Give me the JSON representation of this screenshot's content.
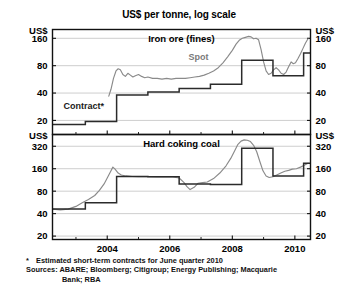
{
  "chart_data": {
    "type": "line",
    "title": "US$ per tonne, log scale",
    "xlabel": "",
    "ylabel": "US$",
    "grid": true,
    "log_scale": true,
    "x_range": [
      2002.25,
      2010.5
    ],
    "x_ticks": [
      2004,
      2006,
      2008,
      2010
    ],
    "x_tick_labels": [
      "2004",
      "2006",
      "2008",
      "2010"
    ],
    "x_minor_ticks": [
      2003,
      2005,
      2007,
      2009
    ],
    "panels": [
      {
        "name": "iron-ore",
        "title": "Iron ore (fines)",
        "ylim": [
          14,
          200
        ],
        "y_ticks": [
          20,
          40,
          80,
          160
        ],
        "y_tick_labels": [
          "20",
          "40",
          "80",
          "160"
        ],
        "axis_unit_label": "US$",
        "series": [
          {
            "name": "Spot",
            "label": "Spot",
            "color": "#8a8a8a",
            "points": [
              [
                2004.05,
                37
              ],
              [
                2004.12,
                44
              ],
              [
                2004.2,
                58
              ],
              [
                2004.28,
                70
              ],
              [
                2004.35,
                74
              ],
              [
                2004.42,
                72
              ],
              [
                2004.5,
                64
              ],
              [
                2004.58,
                61
              ],
              [
                2004.66,
                66
              ],
              [
                2004.74,
                63
              ],
              [
                2004.82,
                60
              ],
              [
                2004.9,
                62
              ],
              [
                2005.0,
                64
              ],
              [
                2005.1,
                61
              ],
              [
                2005.2,
                59
              ],
              [
                2005.3,
                60
              ],
              [
                2005.45,
                58
              ],
              [
                2005.6,
                58
              ],
              [
                2005.75,
                57
              ],
              [
                2005.9,
                58
              ],
              [
                2006.05,
                57
              ],
              [
                2006.2,
                58
              ],
              [
                2006.35,
                58
              ],
              [
                2006.5,
                58
              ],
              [
                2006.65,
                59
              ],
              [
                2006.8,
                60
              ],
              [
                2006.95,
                61
              ],
              [
                2007.1,
                63
              ],
              [
                2007.25,
                66
              ],
              [
                2007.4,
                70
              ],
              [
                2007.55,
                76
              ],
              [
                2007.7,
                86
              ],
              [
                2007.85,
                100
              ],
              [
                2008.0,
                118
              ],
              [
                2008.12,
                138
              ],
              [
                2008.22,
                152
              ],
              [
                2008.32,
                160
              ],
              [
                2008.42,
                164
              ],
              [
                2008.52,
                168
              ],
              [
                2008.6,
                166
              ],
              [
                2008.68,
                158
              ],
              [
                2008.76,
                160
              ],
              [
                2008.84,
                154
              ],
              [
                2008.92,
                120
              ],
              [
                2009.0,
                88
              ],
              [
                2009.08,
                70
              ],
              [
                2009.16,
                64
              ],
              [
                2009.24,
                66
              ],
              [
                2009.32,
                72
              ],
              [
                2009.4,
                76
              ],
              [
                2009.48,
                72
              ],
              [
                2009.56,
                66
              ],
              [
                2009.64,
                64
              ],
              [
                2009.72,
                68
              ],
              [
                2009.8,
                78
              ],
              [
                2009.88,
                88
              ],
              [
                2009.95,
                84
              ],
              [
                2010.02,
                86
              ],
              [
                2010.1,
                96
              ],
              [
                2010.18,
                108
              ],
              [
                2010.26,
                124
              ],
              [
                2010.34,
                142
              ],
              [
                2010.42,
                158
              ]
            ]
          },
          {
            "name": "Contract",
            "label": "Contract*",
            "color": "#2b2b2b",
            "step": true,
            "points": [
              [
                2002.25,
                18
              ],
              [
                2003.3,
                18
              ],
              [
                2003.3,
                19.5
              ],
              [
                2004.3,
                19.5
              ],
              [
                2004.3,
                38
              ],
              [
                2005.3,
                38
              ],
              [
                2005.3,
                41
              ],
              [
                2006.3,
                41
              ],
              [
                2006.3,
                45
              ],
              [
                2007.3,
                45
              ],
              [
                2007.3,
                50
              ],
              [
                2008.3,
                50
              ],
              [
                2008.3,
                92
              ],
              [
                2009.3,
                92
              ],
              [
                2009.3,
                62
              ],
              [
                2010.28,
                62
              ],
              [
                2010.28,
                110
              ],
              [
                2010.5,
                110
              ]
            ]
          }
        ]
      },
      {
        "name": "hard-coking-coal",
        "title": "Hard coking coal",
        "ylim": [
          18,
          460
        ],
        "y_ticks": [
          20,
          40,
          80,
          160,
          320
        ],
        "y_tick_labels": [
          "20",
          "40",
          "80",
          "160",
          "320"
        ],
        "axis_unit_label": "US$",
        "series": [
          {
            "name": "Spot",
            "color": "#8a8a8a",
            "points": [
              [
                2002.25,
                46
              ],
              [
                2002.5,
                45
              ],
              [
                2002.75,
                46
              ],
              [
                2003.0,
                50
              ],
              [
                2003.2,
                56
              ],
              [
                2003.4,
                62
              ],
              [
                2003.6,
                70
              ],
              [
                2003.75,
                82
              ],
              [
                2003.9,
                100
              ],
              [
                2004.0,
                120
              ],
              [
                2004.1,
                145
              ],
              [
                2004.18,
                168
              ],
              [
                2004.25,
                158
              ],
              [
                2004.35,
                140
              ],
              [
                2004.45,
                132
              ],
              [
                2004.6,
                128
              ],
              [
                2004.8,
                126
              ],
              [
                2005.0,
                125
              ],
              [
                2005.3,
                125
              ],
              [
                2005.6,
                124
              ],
              [
                2005.9,
                125
              ],
              [
                2006.1,
                124
              ],
              [
                2006.3,
                120
              ],
              [
                2006.45,
                105
              ],
              [
                2006.55,
                92
              ],
              [
                2006.65,
                84
              ],
              [
                2006.78,
                90
              ],
              [
                2006.9,
                102
              ],
              [
                2007.05,
                104
              ],
              [
                2007.2,
                106
              ],
              [
                2007.4,
                118
              ],
              [
                2007.6,
                140
              ],
              [
                2007.8,
                175
              ],
              [
                2007.95,
                220
              ],
              [
                2008.08,
                280
              ],
              [
                2008.18,
                340
              ],
              [
                2008.28,
                375
              ],
              [
                2008.38,
                390
              ],
              [
                2008.48,
                385
              ],
              [
                2008.58,
                370
              ],
              [
                2008.68,
                330
              ],
              [
                2008.78,
                270
              ],
              [
                2008.88,
                200
              ],
              [
                2008.98,
                150
              ],
              [
                2009.08,
                128
              ],
              [
                2009.18,
                122
              ],
              [
                2009.3,
                125
              ],
              [
                2009.42,
                132
              ],
              [
                2009.55,
                140
              ],
              [
                2009.68,
                148
              ],
              [
                2009.8,
                152
              ],
              [
                2009.92,
                158
              ],
              [
                2010.05,
                160
              ],
              [
                2010.18,
                168
              ],
              [
                2010.3,
                178
              ],
              [
                2010.42,
                190
              ]
            ]
          },
          {
            "name": "Contract",
            "color": "#2b2b2b",
            "step": true,
            "points": [
              [
                2002.25,
                46
              ],
              [
                2003.3,
                46
              ],
              [
                2003.3,
                56
              ],
              [
                2004.3,
                56
              ],
              [
                2004.3,
                126
              ],
              [
                2005.3,
                126
              ],
              [
                2005.3,
                125
              ],
              [
                2006.3,
                125
              ],
              [
                2006.3,
                100
              ],
              [
                2007.3,
                100
              ],
              [
                2007.3,
                98
              ],
              [
                2008.3,
                98
              ],
              [
                2008.3,
                300
              ],
              [
                2009.3,
                300
              ],
              [
                2009.3,
                128
              ],
              [
                2010.28,
                128
              ],
              [
                2010.28,
                190
              ],
              [
                2010.5,
                190
              ]
            ]
          }
        ]
      }
    ],
    "footnotes": [
      {
        "marker": "*",
        "text": "Estimated short-term contracts for June quarter 2010"
      }
    ],
    "sources_line1": "Sources: ABARE; Bloomberg; Citigroup; Energy Publishing; Macquarie",
    "sources_line2": "Bank; RBA"
  }
}
